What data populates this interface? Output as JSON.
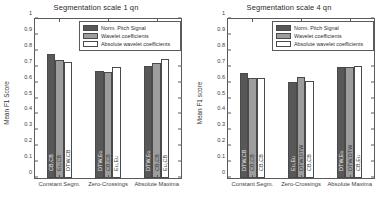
{
  "figure": {
    "background": "#ffffff",
    "series_colors": [
      "#585858",
      "#9d9d9d",
      "#ffffff"
    ]
  },
  "chart_data": [
    {
      "type": "bar",
      "title": "Segmentation scale 1 qn",
      "xlabel": "",
      "ylabel": "Mean F1 Score",
      "ylim": [
        0,
        1
      ],
      "yticks": [
        "0",
        "0.1",
        "0.2",
        "0.3",
        "0.4",
        "0.5",
        "0.6",
        "0.7",
        "0.8",
        "0.9",
        "1"
      ],
      "grid": false,
      "legend_position": "top-center",
      "categories": [
        "Constant Segm.",
        "Zero-Crossings",
        "Absolute Maxima"
      ],
      "series": [
        {
          "name": "Norm. Pitch Signal",
          "values": [
            0.78,
            0.675,
            0.703
          ]
        },
        {
          "name": "Wavelet coefficients",
          "values": [
            0.74,
            0.668,
            0.723
          ]
        },
        {
          "name": "Absolute wavelet coefficients",
          "values": [
            0.728,
            0.699,
            0.747
          ]
        }
      ],
      "bar_annotations": [
        [
          "CB,CB",
          "DTW,Eu",
          "DTW,Eu"
        ],
        [
          "Eu,CB",
          "CB,CB",
          "CB,CB"
        ],
        [
          "DTW,CB",
          "Eu,Eu",
          "Eu,CB"
        ]
      ]
    },
    {
      "type": "bar",
      "title": "Segmentation scale 4 qn",
      "xlabel": "",
      "ylabel": "Mean F1 score",
      "ylim": [
        0,
        1
      ],
      "yticks": [
        "0",
        "0.1",
        "0.2",
        "0.3",
        "0.4",
        "0.5",
        "0.6",
        "0.7",
        "0.8",
        "0.9",
        "1"
      ],
      "grid": false,
      "legend_position": "top-center",
      "categories": [
        "Constant Segm.",
        "Zero-Crossings",
        "Absolute Maxima"
      ],
      "series": [
        {
          "name": "Norm. Pitch Signal",
          "values": [
            0.662,
            0.606,
            0.7
          ]
        },
        {
          "name": "Wavelet coefficients",
          "values": [
            0.626,
            0.634,
            0.701
          ]
        },
        {
          "name": "Absolute wavelet coefficients",
          "values": [
            0.63,
            0.612,
            0.702
          ]
        }
      ],
      "bar_annotations": [
        [
          "DTW,CB",
          "Eu,Eu",
          "DTW,Eu"
        ],
        [
          "CB,CB",
          "DTW,DTW",
          "DTW,DTW"
        ],
        [
          "CB,CB",
          "CB,CB",
          "CB,Eu"
        ]
      ]
    }
  ]
}
